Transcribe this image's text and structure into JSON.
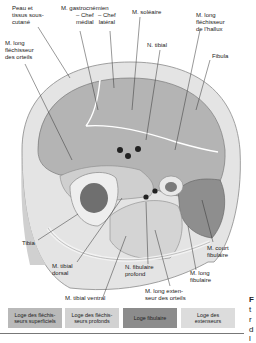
{
  "diagram": {
    "labels": {
      "peau": [
        "Peau et",
        "tissus sous-",
        "cutané"
      ],
      "gastrocnemien": [
        "M. gastrocnémien",
        "– Chef",
        "médial"
      ],
      "gastrocnemien_lateral": [
        "– Chef",
        "latéral"
      ],
      "soleaire": "M. soléaire",
      "long_flechisseur_orteils": [
        "M. long",
        "fléchisseur",
        "des orteils"
      ],
      "long_flechisseur_hallux": [
        "M. long",
        "fléchisseur",
        "de l'hallux"
      ],
      "n_tibial": "N. tibial",
      "fibula": "Fibula",
      "tibia": "Tibia",
      "tibial_dorsal": [
        "M. tibial",
        "dorsal"
      ],
      "tibial_ventral": "M. tibial ventral",
      "n_fibulaire_profond": [
        "N. fibulaire",
        "profond"
      ],
      "long_extenseur_orteils": [
        "M. long exten-",
        "seur des orteils"
      ],
      "court_fibulaire": [
        "M. court",
        "fibulaire"
      ],
      "long_fibulaire": [
        "M. long",
        "fibulaire"
      ]
    },
    "legend": [
      {
        "label": [
          "Loge des fléchis-",
          "seurs superficiels"
        ],
        "color": "#b9b9b9"
      },
      {
        "label": [
          "Loge des fléchis-",
          "seurs profonds"
        ],
        "color": "#d2d2d2"
      },
      {
        "label": [
          "Loge fibulaire"
        ],
        "color": "#8c8c8c"
      },
      {
        "label": [
          "Loge des",
          "extenseurs"
        ],
        "color": "#dcdcdc"
      }
    ],
    "side_text": [
      "F",
      "t",
      "r",
      "d",
      "l"
    ]
  }
}
